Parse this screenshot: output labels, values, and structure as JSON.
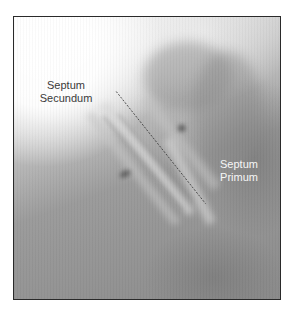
{
  "figure": {
    "labels": {
      "septum_secundum": {
        "line1": "Septum",
        "line2": "Secundum"
      },
      "septum_primum": {
        "line1": "Septum",
        "line2": "Primum"
      }
    },
    "annotation": {
      "type": "dashed-line",
      "from": [
        116,
        91
      ],
      "to": [
        206,
        204
      ],
      "color": "#3a3a3a"
    },
    "colors": {
      "frame_border": "#2a2a2a",
      "background_gray": "#8c8c8c",
      "label_dark": "#3a3a3a",
      "label_light": "#f6f6f6"
    }
  }
}
